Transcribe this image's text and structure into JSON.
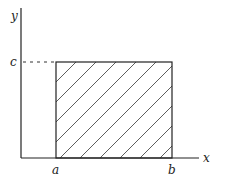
{
  "diagram": {
    "axes": {
      "x_label": "x",
      "y_label": "y"
    },
    "ticks": {
      "x": [
        "a",
        "b"
      ],
      "y": [
        "c"
      ]
    },
    "region": {
      "description": "hatched rectangle from a to b, height c",
      "fill": "diagonal hatch"
    },
    "colors": {
      "line": "#222222",
      "background": "#ffffff"
    }
  }
}
